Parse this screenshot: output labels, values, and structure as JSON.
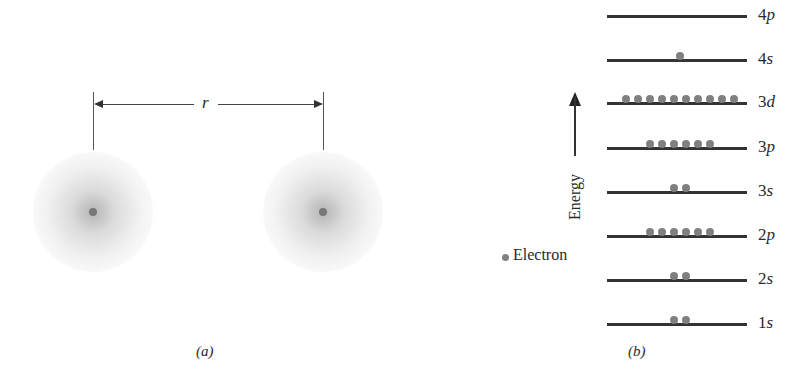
{
  "panel_a": {
    "caption": "(a)",
    "distance_label": "r",
    "atoms": [
      {
        "name": "left-atom",
        "cx": 93,
        "cy": 212
      },
      {
        "name": "right-atom",
        "cx": 323,
        "cy": 212
      }
    ]
  },
  "panel_b": {
    "caption": "(b)",
    "axis_label": "Energy",
    "legend_label": "Electron",
    "levels": [
      {
        "label_num": "4",
        "label_orb": "p",
        "y": 15,
        "electrons": 0
      },
      {
        "label_num": "4",
        "label_orb": "s",
        "y": 59,
        "electrons": 1
      },
      {
        "label_num": "3",
        "label_orb": "d",
        "y": 102,
        "electrons": 10
      },
      {
        "label_num": "3",
        "label_orb": "p",
        "y": 147,
        "electrons": 6
      },
      {
        "label_num": "3",
        "label_orb": "s",
        "y": 191,
        "electrons": 2
      },
      {
        "label_num": "2",
        "label_orb": "p",
        "y": 235,
        "electrons": 6
      },
      {
        "label_num": "2",
        "label_orb": "s",
        "y": 279,
        "electrons": 2
      },
      {
        "label_num": "1",
        "label_orb": "s",
        "y": 323,
        "electrons": 2
      }
    ]
  }
}
